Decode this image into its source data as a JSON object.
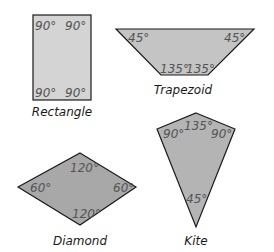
{
  "colors": {
    "outline": "#1a1a1a",
    "angle_text": "#555555",
    "rectangle_fill": "#d4d4d4",
    "trapezoid_fill": "#c4c4c4",
    "diamond_fill": "#a8a8a8",
    "kite_fill": "#b4b4b4"
  },
  "shapes": {
    "rectangle": {
      "name": "Rectangle",
      "angles": {
        "top_left": "90°",
        "top_right": "90°",
        "bottom_left": "90°",
        "bottom_right": "90°"
      }
    },
    "trapezoid": {
      "name": "Trapezoid",
      "angles": {
        "top_left": "45°",
        "top_right": "45°",
        "bottom_left": "135°",
        "bottom_right": "135°"
      }
    },
    "diamond": {
      "name": "Diamond",
      "angles": {
        "top": "120°",
        "left": "60°",
        "right": "60°",
        "bottom": "120°"
      }
    },
    "kite": {
      "name": "Kite",
      "angles": {
        "top": "135°",
        "left": "90°",
        "right": "90°",
        "bottom": "45°"
      }
    }
  }
}
